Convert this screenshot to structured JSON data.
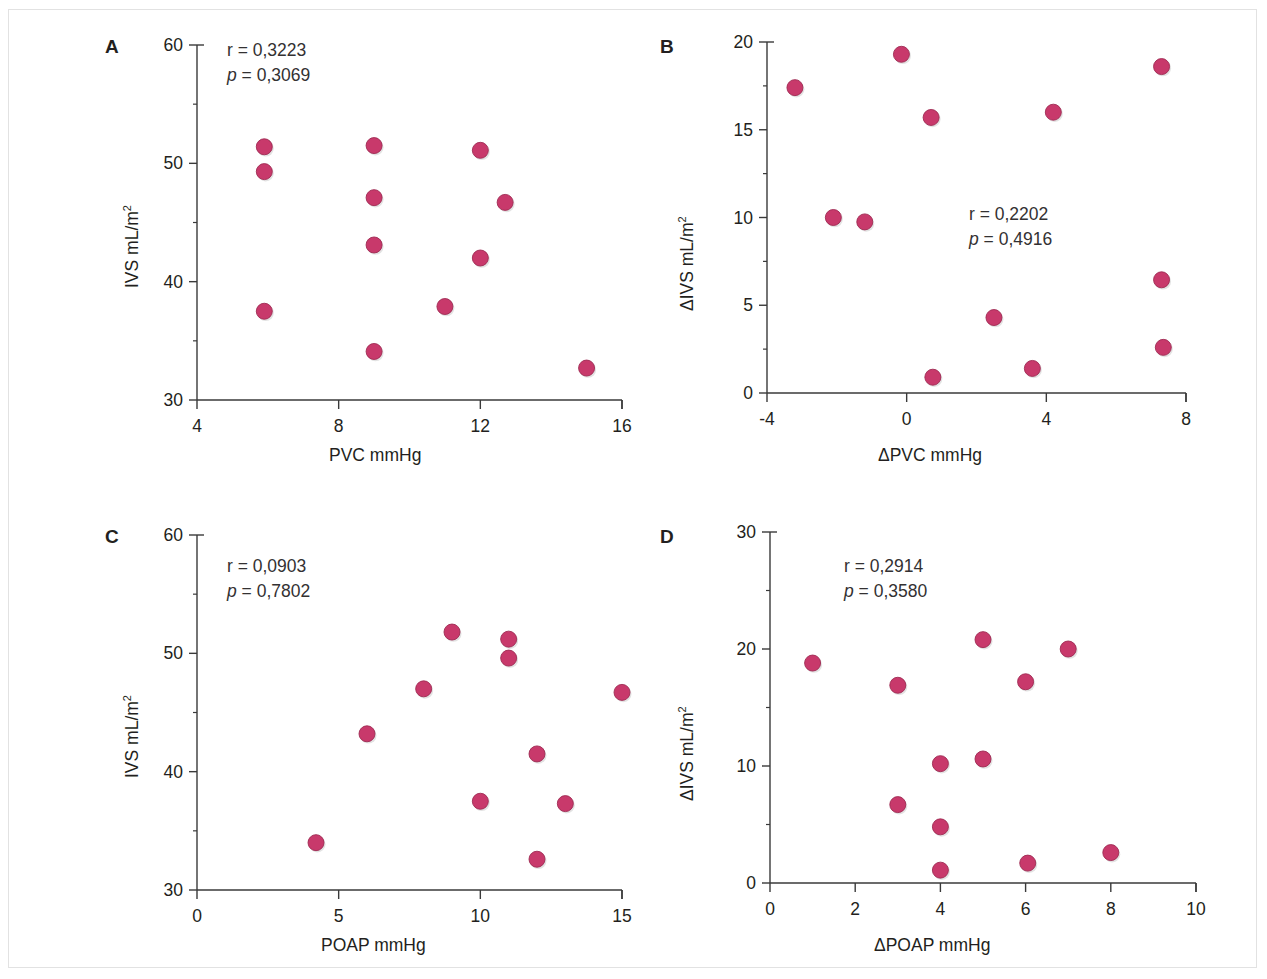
{
  "figure": {
    "marker_color": "#c8396b",
    "marker_edge_color": "#9e2a52",
    "axis_color": "#3a3a3a",
    "text_color": "#231f20",
    "frame_color": "#e2e2e2",
    "background": "#ffffff"
  },
  "panels": [
    {
      "letter": "A",
      "stat_r": "r = 0,3223",
      "stat_p_italic": "p",
      "stat_p_rest": " = 0,3069",
      "xlabel": "PVC mmHg",
      "ylabel_main": "IVS  mL/m",
      "ylabel_sup": "2"
    },
    {
      "letter": "B",
      "stat_r": "r = 0,2202",
      "stat_p_italic": "p",
      "stat_p_rest": " = 0,4916",
      "xlabel": "ΔPVC mmHg",
      "ylabel_main": "ΔIVS mL/m",
      "ylabel_sup": "2"
    },
    {
      "letter": "C",
      "stat_r": "r = 0,0903",
      "stat_p_italic": "p",
      "stat_p_rest": " = 0,7802",
      "xlabel": "POAP mmHg",
      "ylabel_main": "IVS  mL/m",
      "ylabel_sup": "2"
    },
    {
      "letter": "D",
      "stat_r": "r = 0,2914",
      "stat_p_italic": "p",
      "stat_p_rest": " = 0,3580",
      "xlabel": "ΔPOAP mmHg",
      "ylabel_main": "ΔIVS mL/m",
      "ylabel_sup": "2"
    }
  ],
  "chart_data": [
    {
      "id": "A",
      "type": "scatter",
      "title": "A",
      "xlabel": "PVC mmHg",
      "ylabel": "IVS mL/m2",
      "xlim": [
        4,
        16
      ],
      "ylim": [
        30,
        60
      ],
      "xticks": [
        4,
        8,
        12,
        16
      ],
      "yticks": [
        30,
        40,
        50,
        60
      ],
      "grid": false,
      "legend": "none",
      "annotations": [
        "r = 0,3223",
        "p = 0,3069"
      ],
      "r": 0.3223,
      "p": 0.3069,
      "points": [
        {
          "x": 5.9,
          "y": 51.4
        },
        {
          "x": 5.9,
          "y": 49.3
        },
        {
          "x": 5.9,
          "y": 37.5
        },
        {
          "x": 9.0,
          "y": 51.5
        },
        {
          "x": 9.0,
          "y": 47.1
        },
        {
          "x": 9.0,
          "y": 43.1
        },
        {
          "x": 9.0,
          "y": 34.1
        },
        {
          "x": 11.0,
          "y": 37.9
        },
        {
          "x": 12.0,
          "y": 51.1
        },
        {
          "x": 12.0,
          "y": 42.0
        },
        {
          "x": 12.7,
          "y": 46.7
        },
        {
          "x": 15.0,
          "y": 32.7
        }
      ]
    },
    {
      "id": "B",
      "type": "scatter",
      "title": "B",
      "xlabel": "ΔPVC mmHg",
      "ylabel": "ΔIVS mL/m2",
      "xlim": [
        -4,
        8
      ],
      "ylim": [
        0,
        20
      ],
      "xticks": [
        -4,
        0,
        4,
        8
      ],
      "yticks": [
        0,
        5,
        10,
        15,
        20
      ],
      "grid": false,
      "legend": "none",
      "annotations": [
        "r = 0,2202",
        "p = 0,4916"
      ],
      "r": 0.2202,
      "p": 0.4916,
      "points": [
        {
          "x": -3.2,
          "y": 17.4
        },
        {
          "x": -2.1,
          "y": 10.0
        },
        {
          "x": -1.2,
          "y": 9.75
        },
        {
          "x": -0.15,
          "y": 19.3
        },
        {
          "x": 0.7,
          "y": 15.7
        },
        {
          "x": 0.75,
          "y": 0.9
        },
        {
          "x": 2.5,
          "y": 4.3
        },
        {
          "x": 3.6,
          "y": 1.4
        },
        {
          "x": 4.2,
          "y": 16.0
        },
        {
          "x": 7.3,
          "y": 18.6
        },
        {
          "x": 7.3,
          "y": 6.45
        },
        {
          "x": 7.35,
          "y": 2.6
        }
      ]
    },
    {
      "id": "C",
      "type": "scatter",
      "title": "C",
      "xlabel": "POAP mmHg",
      "ylabel": "IVS mL/m2",
      "xlim": [
        0,
        15
      ],
      "ylim": [
        30,
        60
      ],
      "xticks": [
        0,
        5,
        10,
        15
      ],
      "yticks": [
        30,
        40,
        50,
        60
      ],
      "grid": false,
      "legend": "none",
      "annotations": [
        "r = 0,0903",
        "p = 0,7802"
      ],
      "r": 0.0903,
      "p": 0.7802,
      "points": [
        {
          "x": 4.2,
          "y": 34.0
        },
        {
          "x": 6.0,
          "y": 43.2
        },
        {
          "x": 8.0,
          "y": 47.0
        },
        {
          "x": 9.0,
          "y": 51.8
        },
        {
          "x": 10.0,
          "y": 37.5
        },
        {
          "x": 11.0,
          "y": 51.2
        },
        {
          "x": 11.0,
          "y": 49.6
        },
        {
          "x": 12.0,
          "y": 41.5
        },
        {
          "x": 12.0,
          "y": 32.6
        },
        {
          "x": 13.0,
          "y": 37.3
        },
        {
          "x": 15.0,
          "y": 46.7
        }
      ]
    },
    {
      "id": "D",
      "type": "scatter",
      "title": "D",
      "xlabel": "ΔPOAP mmHg",
      "ylabel": "ΔIVS mL/m2",
      "xlim": [
        0,
        10
      ],
      "ylim": [
        0,
        30
      ],
      "xticks": [
        0,
        2,
        4,
        6,
        8,
        10
      ],
      "yticks": [
        0,
        10,
        20,
        30
      ],
      "grid": false,
      "legend": "none",
      "annotations": [
        "r = 0,2914",
        "p = 0,3580"
      ],
      "r": 0.2914,
      "p": 0.358,
      "points": [
        {
          "x": 1.0,
          "y": 18.8
        },
        {
          "x": 3.0,
          "y": 16.9
        },
        {
          "x": 3.0,
          "y": 6.7
        },
        {
          "x": 4.0,
          "y": 10.2
        },
        {
          "x": 4.0,
          "y": 4.8
        },
        {
          "x": 4.0,
          "y": 1.1
        },
        {
          "x": 5.0,
          "y": 20.8
        },
        {
          "x": 5.0,
          "y": 10.6
        },
        {
          "x": 6.0,
          "y": 17.2
        },
        {
          "x": 6.05,
          "y": 1.7
        },
        {
          "x": 7.0,
          "y": 20.0
        },
        {
          "x": 8.0,
          "y": 2.6
        }
      ]
    }
  ]
}
